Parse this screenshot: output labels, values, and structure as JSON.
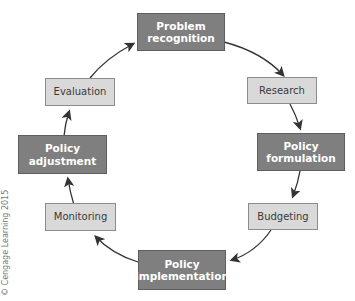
{
  "diagram": {
    "type": "cycle",
    "steps": [
      {
        "label": "Problem recognition",
        "line1": "Problem",
        "line2": "recognition",
        "style": "dark"
      },
      {
        "label": "Research",
        "style": "light"
      },
      {
        "label": "Policy formulation",
        "line1": "Policy",
        "line2": "formulation",
        "style": "dark"
      },
      {
        "label": "Budgeting",
        "style": "light"
      },
      {
        "label": "Policy implementation",
        "line1": "Policy",
        "line2": "implementation",
        "style": "dark"
      },
      {
        "label": "Monitoring",
        "style": "light"
      },
      {
        "label": "Policy adjustment",
        "line1": "Policy",
        "line2": "adjustment",
        "style": "dark"
      },
      {
        "label": "Evaluation",
        "style": "light"
      }
    ],
    "flow_direction": "clockwise"
  },
  "colors": {
    "dark_box": "#7f7f7f",
    "light_box": "#d9d9d9",
    "arrow": "#333333"
  },
  "copyright": "© Cengage Learning 2015"
}
